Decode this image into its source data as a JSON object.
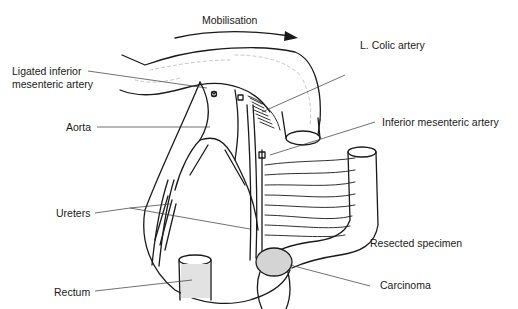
{
  "diagram": {
    "type": "anatomical line drawing",
    "labels": {
      "mobilisation": "Mobilisation",
      "ligated_ima_line1": "Ligated inferior",
      "ligated_ima_line2": "mesenteric artery",
      "l_colic": "L. Colic artery",
      "aorta": "Aorta",
      "ima": "Inferior mesenteric artery",
      "ureters": "Ureters",
      "resected": "Resected specimen",
      "rectum": "Rectum",
      "carcinoma": "Carcinoma"
    },
    "colors": {
      "line": "#1a1a1a",
      "leader": "#333333",
      "shading": "#cfcfcf",
      "background": "#ffffff"
    }
  }
}
